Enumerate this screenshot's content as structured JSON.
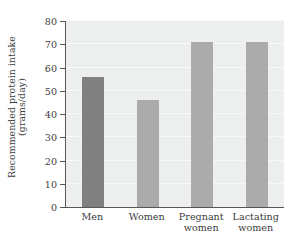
{
  "chart_data": {
    "type": "bar",
    "title": "",
    "subtitle": "",
    "xlabel": "",
    "ylabel": "Recommended protein intake (grams/day)",
    "ylabel_lines": [
      "Recommended protein intake",
      "(grams/day)"
    ],
    "categories": [
      "Men",
      "Women",
      "Pregnant women",
      "Lactating women"
    ],
    "category_lines": [
      [
        "Men"
      ],
      [
        "Women"
      ],
      [
        "Pregnant",
        "women"
      ],
      [
        "Lactating",
        "women"
      ]
    ],
    "values": [
      56,
      46,
      71,
      71
    ],
    "ylim": [
      0,
      80
    ],
    "ytick_step": 10,
    "yticks": [
      0,
      10,
      20,
      30,
      40,
      50,
      60,
      70,
      80
    ],
    "ytick_labels": [
      "0",
      "10",
      "20",
      "30",
      "40",
      "50",
      "60",
      "70",
      "80"
    ],
    "grid": true,
    "legend": false,
    "legend_position": "none",
    "bar_colors": [
      "#808080",
      "#ababab",
      "#ababab",
      "#ababab"
    ],
    "plot_background": "#edeeee",
    "axis_color": "#565656",
    "gridline_color": "#f7f8f8",
    "text_color": "#3c3c3c"
  }
}
